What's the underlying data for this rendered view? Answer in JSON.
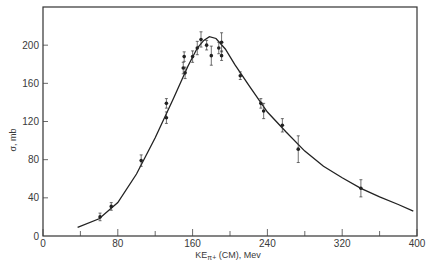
{
  "chart_data": {
    "type": "scatter",
    "title": "",
    "xlabel": "KE π+ (CM), Mev",
    "xlabel_main": "KE",
    "xlabel_sub": "π+",
    "xlabel_rest": " (CM), Mev",
    "ylabel": "σ, mb",
    "xlim": [
      0,
      400
    ],
    "ylim": [
      0,
      240
    ],
    "xticks": [
      0,
      80,
      160,
      240,
      320,
      400
    ],
    "xticks_minor": [
      40,
      120,
      200,
      280,
      360
    ],
    "yticks": [
      0,
      40,
      80,
      120,
      160,
      200
    ],
    "grid": false,
    "legend": null,
    "series": [
      {
        "name": "measured cross section",
        "kind": "points_with_error_bars",
        "points": [
          {
            "x": 61,
            "y": 20,
            "err": 4
          },
          {
            "x": 73,
            "y": 31,
            "err": 4
          },
          {
            "x": 105,
            "y": 79,
            "err": 6
          },
          {
            "x": 132,
            "y": 139,
            "err": 5
          },
          {
            "x": 132,
            "y": 124,
            "err": 6
          },
          {
            "x": 150,
            "y": 176,
            "err": 6
          },
          {
            "x": 151,
            "y": 188,
            "err": 5
          },
          {
            "x": 152,
            "y": 171,
            "err": 6
          },
          {
            "x": 160,
            "y": 188,
            "err": 6
          },
          {
            "x": 165,
            "y": 197,
            "err": 7
          },
          {
            "x": 169,
            "y": 206,
            "err": 8
          },
          {
            "x": 175,
            "y": 200,
            "err": 5
          },
          {
            "x": 180,
            "y": 189,
            "err": 10
          },
          {
            "x": 188,
            "y": 197,
            "err": 6
          },
          {
            "x": 191,
            "y": 203,
            "err": 10
          },
          {
            "x": 191,
            "y": 189,
            "err": 5
          },
          {
            "x": 211,
            "y": 168,
            "err": 4
          },
          {
            "x": 233,
            "y": 139,
            "err": 5
          },
          {
            "x": 236,
            "y": 131,
            "err": 8
          },
          {
            "x": 256,
            "y": 116,
            "err": 7
          },
          {
            "x": 273,
            "y": 91,
            "err": 14
          },
          {
            "x": 340,
            "y": 50,
            "err": 9
          }
        ]
      },
      {
        "name": "theoretical curve",
        "kind": "line",
        "x": [
          37,
          60,
          80,
          100,
          120,
          140,
          155,
          165,
          172,
          178,
          185,
          195,
          205,
          220,
          240,
          260,
          280,
          300,
          320,
          340,
          360,
          380,
          396
        ],
        "y": [
          9,
          18,
          35,
          65,
          103,
          145,
          178,
          197,
          205,
          209,
          207,
          196,
          180,
          158,
          130,
          109,
          89,
          73,
          61,
          50,
          41,
          33,
          26
        ]
      }
    ]
  }
}
